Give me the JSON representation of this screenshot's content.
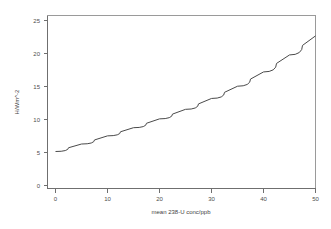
{
  "chart_data": {
    "type": "line",
    "title": "",
    "subtitle": "",
    "xlabel": "mean 238-U conc/ppb",
    "ylabel": "H/Wm^-2",
    "xlim": [
      0,
      50
    ],
    "ylim": [
      0,
      25
    ],
    "xticks": [
      0,
      10,
      20,
      30,
      40,
      50
    ],
    "yticks": [
      0,
      5,
      10,
      15,
      20,
      25
    ],
    "xtick_labels": [
      "0",
      "10",
      "20",
      "30",
      "40",
      "50"
    ],
    "ytick_labels": [
      "0",
      "5",
      "10",
      "15",
      "20",
      "25"
    ],
    "grid": false,
    "legend": false,
    "legend_position": "none",
    "line_color": "#4a4a4a",
    "frame_color": "#6f6f6f",
    "background_color": "#ffffff",
    "series": [
      {
        "name": "H vs mean 238-U conc",
        "color": "#4a4a4a",
        "x": [
          0,
          5,
          10,
          15,
          20,
          25,
          30,
          35,
          40,
          45,
          50
        ],
        "y": [
          5.0,
          6.1,
          7.3,
          8.5,
          9.8,
          11.2,
          12.8,
          14.6,
          16.7,
          19.2,
          22.0
        ]
      }
    ]
  },
  "axis": {
    "x_title": "mean 238-U conc/ppb",
    "y_title": "H/Wm^-2"
  }
}
